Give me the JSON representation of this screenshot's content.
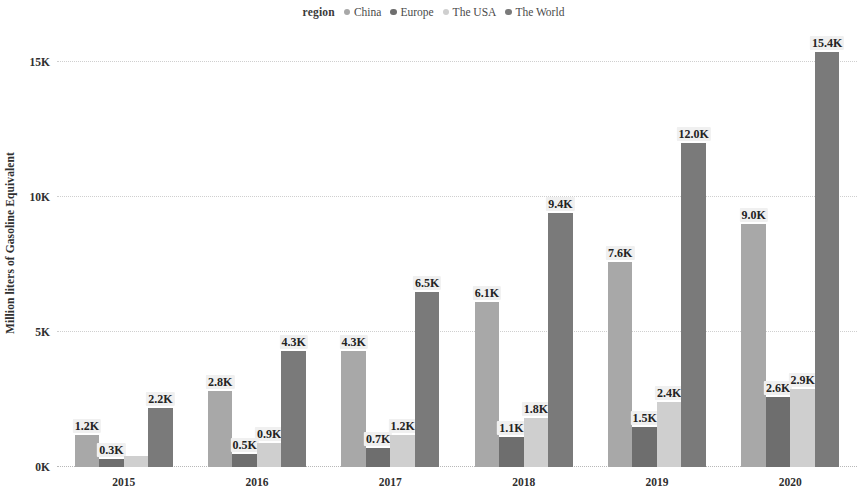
{
  "legend": {
    "title": "region",
    "entries": [
      {
        "label": "China",
        "color": "#a8a8a8"
      },
      {
        "label": "Europe",
        "color": "#6e6e6e"
      },
      {
        "label": "The USA",
        "color": "#cfcfcf"
      },
      {
        "label": "The World",
        "color": "#7a7a7a"
      }
    ]
  },
  "chart_data": {
    "type": "bar",
    "title": "",
    "subtitle": "",
    "xlabel": "",
    "ylabel": "Million liters of Gasoline Equivalent",
    "legend_title": "region",
    "legend_position": "top-center",
    "grid": true,
    "grid_style": "dotted-horizontal",
    "categories": [
      "2015",
      "2016",
      "2017",
      "2018",
      "2019",
      "2020"
    ],
    "ylim": [
      0,
      16200
    ],
    "yticks": [
      0,
      5000,
      10000,
      15000
    ],
    "ytick_labels": [
      "0K",
      "5K",
      "10K",
      "15K"
    ],
    "series": [
      {
        "name": "China",
        "color": "#a8a8a8",
        "values": [
          1200,
          2800,
          4300,
          6100,
          7600,
          9000
        ],
        "labels": [
          "1.2K",
          "2.8K",
          "4.3K",
          "6.1K",
          "7.6K",
          "9.0K"
        ]
      },
      {
        "name": "Europe",
        "color": "#6e6e6e",
        "values": [
          300,
          500,
          700,
          1100,
          1500,
          2600
        ],
        "labels": [
          "0.3K",
          "0.5K",
          "0.7K",
          "1.1K",
          "1.5K",
          "2.6K"
        ]
      },
      {
        "name": "The USA",
        "color": "#cfcfcf",
        "values": [
          400,
          900,
          1200,
          1800,
          2400,
          2900
        ],
        "labels": [
          "",
          "0.9K",
          "1.2K",
          "1.8K",
          "2.4K",
          "2.9K"
        ]
      },
      {
        "name": "The World",
        "color": "#7a7a7a",
        "values": [
          2200,
          4300,
          6500,
          9400,
          12000,
          15400
        ],
        "labels": [
          "2.2K",
          "4.3K",
          "6.5K",
          "9.4K",
          "12.0K",
          "15.4K"
        ]
      }
    ]
  }
}
